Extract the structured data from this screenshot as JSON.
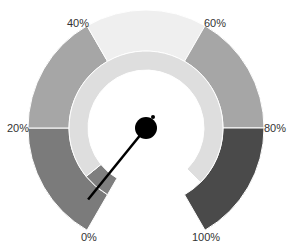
{
  "chart_data": {
    "type": "gauge",
    "title": "",
    "value_percent": 3,
    "range": [
      0,
      100
    ],
    "start_angle_deg": 240,
    "end_angle_deg": -60,
    "tick_labels": [
      "0%",
      "20%",
      "40%",
      "60%",
      "80%",
      "100%"
    ],
    "tick_values": [
      0,
      20,
      40,
      60,
      80,
      100
    ],
    "bands": [
      {
        "from": 0,
        "to": 20,
        "color": "#7b7b7b"
      },
      {
        "from": 20,
        "to": 40,
        "color": "#a6a6a6"
      },
      {
        "from": 40,
        "to": 60,
        "color": "#efefef"
      },
      {
        "from": 60,
        "to": 80,
        "color": "#a6a6a6"
      },
      {
        "from": 80,
        "to": 100,
        "color": "#4a4a4a"
      }
    ],
    "inner_ring": [
      {
        "from": 0,
        "to": 7,
        "color": "#7f7f7f"
      },
      {
        "from": 7,
        "to": 95,
        "color": "#dedede"
      }
    ],
    "needle_color": "#000000",
    "pivot_color": "#000000"
  },
  "labels": {
    "t0": "0%",
    "t20": "20%",
    "t40": "40%",
    "t60": "60%",
    "t80": "80%",
    "t100": "100%"
  }
}
